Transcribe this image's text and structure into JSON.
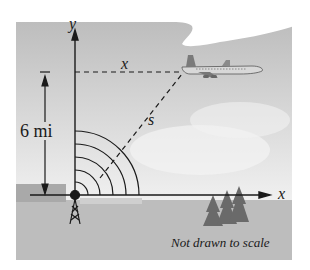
{
  "figure": {
    "labels": {
      "y_axis": "y",
      "x_axis": "x",
      "horizontal_distance": "x",
      "slant_distance": "s",
      "altitude": "6 mi",
      "note": "Not drawn to scale"
    },
    "elements": [
      "radar tower at origin",
      "airplane",
      "concentric radar arcs",
      "trees",
      "cloud",
      "ground"
    ],
    "colors": {
      "sky": "#c9c9c9",
      "ground": "#bdbdbd",
      "line": "#1a1a1a"
    }
  }
}
